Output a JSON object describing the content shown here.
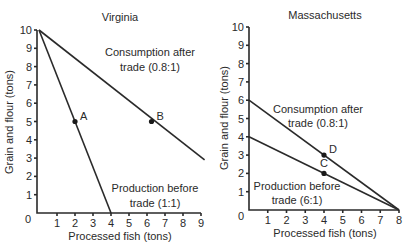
{
  "chart_data": [
    {
      "type": "line",
      "title": "Virginia",
      "xlabel": "Processed fish (tons)",
      "ylabel": "Grain and flour (tons)",
      "xlim": [
        0,
        9
      ],
      "ylim": [
        0,
        10
      ],
      "x_ticks": [
        1,
        2,
        3,
        4,
        5,
        6,
        7,
        8,
        9
      ],
      "y_ticks": [
        1,
        2,
        3,
        4,
        5,
        6,
        7,
        8,
        9,
        10
      ],
      "origin_label": "0",
      "grid": false,
      "series": [
        {
          "name": "Production before trade (1:1)",
          "line1": "Production before",
          "line2": "trade (1:1)",
          "points": [
            [
              0,
              10
            ],
            [
              4,
              0
            ]
          ]
        },
        {
          "name": "Consumption after trade (0.8:1)",
          "line1": "Consumption after",
          "line2": "trade (0.8:1)",
          "points": [
            [
              0,
              10
            ],
            [
              9.2,
              2.9
            ]
          ]
        }
      ],
      "markers": [
        {
          "label": "A",
          "x": 2,
          "y": 5
        },
        {
          "label": "B",
          "x": 6.25,
          "y": 5
        }
      ]
    },
    {
      "type": "line",
      "title": "Massachusetts",
      "xlabel": "Processed fish (tons)",
      "ylabel": "Grain and flour (tons)",
      "xlim": [
        0,
        8
      ],
      "ylim": [
        0,
        10
      ],
      "x_ticks": [
        1,
        2,
        3,
        4,
        5,
        6,
        7,
        8
      ],
      "y_ticks": [
        1,
        2,
        3,
        4,
        5,
        6,
        7,
        8,
        9,
        10
      ],
      "origin_label": "0",
      "grid": false,
      "series": [
        {
          "name": "Consumption after trade (0.8:1)",
          "line1": "Consumption after",
          "line2": "trade (0.8:1)",
          "points": [
            [
              0,
              6
            ],
            [
              8,
              0
            ]
          ]
        },
        {
          "name": "Production before trade (6:1)",
          "line1": "Production before",
          "line2": "trade (6:1)",
          "points": [
            [
              0,
              4
            ],
            [
              8,
              0
            ]
          ]
        }
      ],
      "markers": [
        {
          "label": "D",
          "x": 4,
          "y": 3
        },
        {
          "label": "C",
          "x": 4,
          "y": 2
        }
      ]
    }
  ]
}
